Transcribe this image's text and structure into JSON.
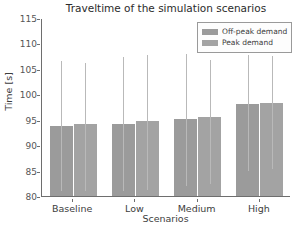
{
  "chart_data": {
    "type": "bar",
    "title": "Traveltime of the simulation scenarios",
    "xlabel": "Scenarios",
    "ylabel": "Time [s]",
    "categories": [
      "Baseline",
      "Low",
      "Medium",
      "High"
    ],
    "ylim": [
      80,
      115
    ],
    "yticks": [
      80,
      85,
      90,
      95,
      100,
      105,
      110,
      115
    ],
    "grid": false,
    "legend_position": "upper right",
    "series": [
      {
        "name": "Off-peak demand",
        "color": "#9b9b9b",
        "values": [
          93.7,
          94.2,
          95.1,
          98.0
        ],
        "err_low": [
          81.2,
          81.2,
          82.1,
          85.1
        ],
        "err_high": [
          106.7,
          107.5,
          108.1,
          107.9
        ]
      },
      {
        "name": "Peak demand",
        "color": "#a3a3a3",
        "values": [
          94.2,
          94.7,
          95.5,
          98.2
        ],
        "err_low": [
          81.2,
          81.3,
          82.6,
          85.5
        ],
        "err_high": [
          106.4,
          108.0,
          107.0,
          107.7
        ]
      }
    ]
  },
  "legend": {
    "items": [
      {
        "label": "Off-peak demand"
      },
      {
        "label": "Peak demand"
      }
    ]
  }
}
